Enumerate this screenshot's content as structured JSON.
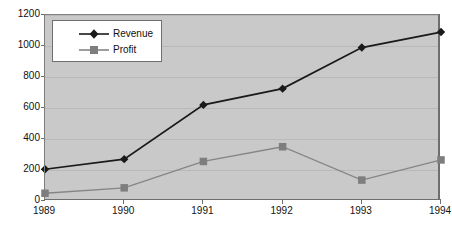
{
  "chart_data": {
    "type": "line",
    "title": "",
    "xlabel": "",
    "ylabel": "",
    "categories": [
      "1989",
      "1990",
      "1991",
      "1992",
      "1993",
      "1994"
    ],
    "ylim": [
      0,
      1200
    ],
    "yticks": [
      0,
      200,
      400,
      600,
      800,
      1000,
      1200
    ],
    "grid": true,
    "legend_position": "top-left",
    "series": [
      {
        "name": "Revenue",
        "marker": "diamond",
        "color": "#1a1a1a",
        "values": [
          205,
          270,
          620,
          725,
          990,
          1090
        ]
      },
      {
        "name": "Profit",
        "marker": "square",
        "color": "#858585",
        "values": [
          50,
          85,
          255,
          350,
          135,
          265
        ]
      }
    ]
  },
  "legend": {
    "items": [
      {
        "label": "Revenue",
        "marker": "diamond-marker-icon"
      },
      {
        "label": "Profit",
        "marker": "square-marker-icon"
      }
    ]
  },
  "colors": {
    "plot_background": "#c9c9c9",
    "page_background": "#ffffff",
    "gridline": "#b9b9b9",
    "axis": "#6e6e6e",
    "revenue": "#1a1a1a",
    "profit": "#858585"
  }
}
